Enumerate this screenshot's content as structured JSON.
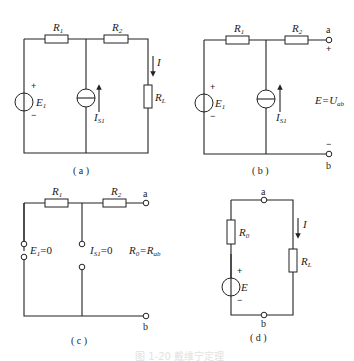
{
  "figure": {
    "caption": "图 1-20 戴维宁定理",
    "panels": [
      {
        "id": "a",
        "label": "( a )",
        "components": {
          "R1": {
            "main": "R",
            "sub": "1"
          },
          "R2": {
            "main": "R",
            "sub": "2"
          },
          "E1": {
            "main": "E",
            "sub": "1"
          },
          "IS1": {
            "main": "I",
            "sub": "S1"
          },
          "RL": {
            "main": "R",
            "sub": "L"
          },
          "I": "I",
          "plus": "+",
          "minus": "−"
        }
      },
      {
        "id": "b",
        "label": "( b )",
        "components": {
          "R1": {
            "main": "R",
            "sub": "1"
          },
          "R2": {
            "main": "R",
            "sub": "2"
          },
          "E1": {
            "main": "E",
            "sub": "1"
          },
          "IS1": {
            "main": "I",
            "sub": "S1"
          },
          "terminal_a": "a",
          "terminal_b": "b",
          "plus": "+",
          "minus": "−",
          "term_plus": "+",
          "term_minus": "−",
          "equation": {
            "lhs": "E=U",
            "sub": "ab"
          }
        }
      },
      {
        "id": "c",
        "label": "( c )",
        "components": {
          "R1": {
            "main": "R",
            "sub": "1"
          },
          "R2": {
            "main": "R",
            "sub": "2"
          },
          "E1_zero": {
            "main": "E",
            "sub": "1",
            "rest": "=0"
          },
          "IS1_zero": {
            "main": "I",
            "sub": "S1",
            "rest": "=0"
          },
          "terminal_a": "a",
          "terminal_b": "b",
          "equation": {
            "lhs": "R",
            "lhs_sub": "0",
            "mid": "=R",
            "rhs_sub": "ab"
          }
        }
      },
      {
        "id": "d",
        "label": "( d )",
        "components": {
          "R0": {
            "main": "R",
            "sub": "0"
          },
          "E": "E",
          "RL": {
            "main": "R",
            "sub": "L"
          },
          "I": "I",
          "terminal_a": "a",
          "terminal_b": "b",
          "plus": "+",
          "minus": "−"
        }
      }
    ]
  }
}
